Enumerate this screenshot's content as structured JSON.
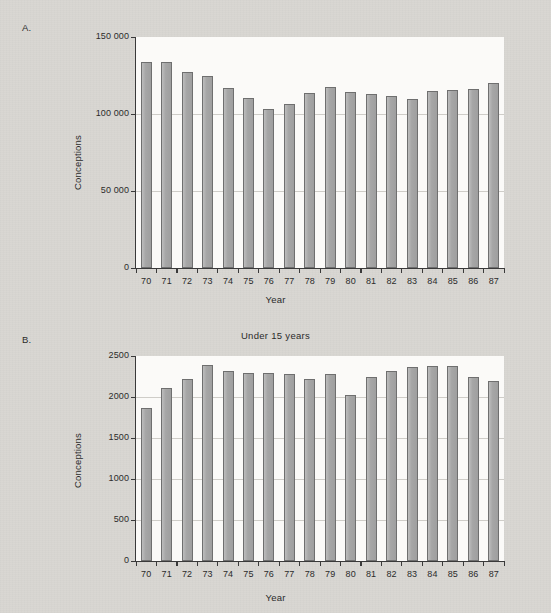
{
  "figure": {
    "background_color": "#d9d7d2",
    "plot_background_color": "#fbfaf8",
    "bar_color": "#a9a9a9",
    "bar_edge_color": "#6f6f6f"
  },
  "panels": [
    {
      "letter": "A.",
      "title": "",
      "chart_data": {
        "type": "bar",
        "title": "",
        "xlabel": "Year",
        "ylabel": "Conceptions",
        "categories": [
          "70",
          "71",
          "72",
          "73",
          "74",
          "75",
          "76",
          "77",
          "78",
          "79",
          "80",
          "81",
          "82",
          "83",
          "84",
          "85",
          "86",
          "87"
        ],
        "values": [
          134000,
          134000,
          127500,
          124500,
          117000,
          110500,
          103500,
          106500,
          113500,
          117500,
          114500,
          113000,
          111500,
          109500,
          115000,
          115500,
          116500,
          120000
        ],
        "ylim": [
          0,
          150000
        ],
        "yticks": [
          0,
          50000,
          100000,
          150000
        ],
        "ytick_labels": [
          "0",
          "50 000",
          "100 000",
          "150 000"
        ],
        "grid": true,
        "legend": "none"
      }
    },
    {
      "letter": "B.",
      "title": "Under 15 years",
      "chart_data": {
        "type": "bar",
        "title": "Under 15 years",
        "xlabel": "Year",
        "ylabel": "Conceptions",
        "categories": [
          "70",
          "71",
          "72",
          "73",
          "74",
          "75",
          "76",
          "77",
          "78",
          "79",
          "80",
          "81",
          "82",
          "83",
          "84",
          "85",
          "86",
          "87"
        ],
        "values": [
          1860,
          2110,
          2215,
          2385,
          2320,
          2295,
          2295,
          2280,
          2215,
          2285,
          2030,
          2250,
          2320,
          2370,
          2380,
          2380,
          2245,
          2200
        ],
        "ylim": [
          0,
          2500
        ],
        "yticks": [
          0,
          500,
          1000,
          1500,
          2000,
          2500
        ],
        "ytick_labels": [
          "0",
          "500",
          "1000",
          "1500",
          "2000",
          "2500"
        ],
        "grid": true,
        "legend": "none"
      }
    }
  ]
}
